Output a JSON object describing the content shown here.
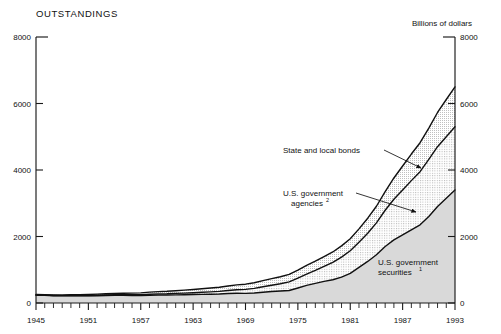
{
  "figure": {
    "title": "OUTSTANDINGS",
    "units_label": "Billions of dollars"
  },
  "chart_data": {
    "type": "area",
    "title": "OUTSTANDINGS",
    "subtitle": "",
    "xlabel": "",
    "ylabel": "Billions of dollars",
    "xlim": [
      1945,
      1993
    ],
    "ylim": [
      0,
      8000
    ],
    "yticks": [
      0,
      2000,
      4000,
      6000,
      8000
    ],
    "ytick_labels": [
      "0",
      "2000",
      "4000",
      "6000",
      "8000"
    ],
    "right_axis_yticks": [
      0,
      2000,
      4000,
      6000,
      8000
    ],
    "right_axis_ytick_labels": [
      "0",
      "2000",
      "4000",
      "6000",
      "8000"
    ],
    "xticks": [
      1945,
      1951,
      1957,
      1963,
      1969,
      1975,
      1981,
      1987,
      1993
    ],
    "xtick_labels": [
      "1945",
      "1951",
      "1957",
      "1963",
      "1969",
      "1975",
      "1981",
      "1987",
      "1993"
    ],
    "x_minor_tick_interval": 1,
    "grid": false,
    "legend_position": "inline-annotations",
    "stacking": "cumulative-from-bottom",
    "x": [
      1945,
      1946,
      1947,
      1948,
      1949,
      1950,
      1951,
      1952,
      1953,
      1954,
      1955,
      1956,
      1957,
      1958,
      1959,
      1960,
      1961,
      1962,
      1963,
      1964,
      1965,
      1966,
      1967,
      1968,
      1969,
      1970,
      1971,
      1972,
      1973,
      1974,
      1975,
      1976,
      1977,
      1978,
      1979,
      1980,
      1981,
      1982,
      1983,
      1984,
      1985,
      1986,
      1987,
      1988,
      1989,
      1990,
      1991,
      1992,
      1993
    ],
    "series": [
      {
        "name": "U.S. government securities",
        "footnote": "1",
        "fill": "light-stipple",
        "values": [
          235,
          230,
          220,
          215,
          215,
          215,
          215,
          220,
          225,
          230,
          230,
          225,
          225,
          235,
          240,
          240,
          245,
          250,
          255,
          260,
          265,
          270,
          285,
          295,
          290,
          300,
          325,
          345,
          360,
          375,
          450,
          530,
          590,
          650,
          700,
          780,
          890,
          1070,
          1250,
          1450,
          1700,
          1900,
          2050,
          2200,
          2350,
          2600,
          2900,
          3150,
          3400
        ],
        "value_at_1993": 3400
      },
      {
        "name": "U.S. government agencies",
        "footnote": "2",
        "fill": "medium-stipple",
        "values": [
          5,
          6,
          7,
          8,
          9,
          10,
          12,
          14,
          16,
          18,
          20,
          23,
          26,
          30,
          34,
          38,
          43,
          48,
          55,
          62,
          70,
          80,
          92,
          105,
          120,
          140,
          165,
          190,
          220,
          260,
          300,
          340,
          390,
          450,
          520,
          600,
          680,
          760,
          850,
          960,
          1090,
          1220,
          1350,
          1480,
          1600,
          1720,
          1800,
          1850,
          1900
        ],
        "value_at_1993": 1900,
        "cumulative_at_1993": 5300
      },
      {
        "name": "State and local bonds",
        "fill": "fine-stipple",
        "values": [
          15,
          16,
          18,
          20,
          22,
          25,
          28,
          32,
          36,
          40,
          45,
          50,
          55,
          62,
          68,
          74,
          82,
          90,
          98,
          106,
          115,
          124,
          134,
          145,
          156,
          168,
          182,
          196,
          210,
          225,
          240,
          258,
          276,
          295,
          315,
          338,
          362,
          400,
          450,
          500,
          560,
          640,
          720,
          800,
          870,
          940,
          1030,
          1120,
          1200
        ],
        "value_at_1993": 1200,
        "cumulative_at_1993": 6500
      }
    ],
    "annotations": [
      {
        "text": "State and local bonds",
        "footnote": "",
        "points_to_series": "State and local bonds",
        "points_to_year": 1988
      },
      {
        "text": "U.S. government agencies",
        "footnote": "2",
        "points_to_series": "U.S. government agencies",
        "points_to_year": 1988
      },
      {
        "text": "U.S. government securities",
        "footnote": "1",
        "points_to_series": "U.S. government securities",
        "points_to_year": 1989
      }
    ]
  },
  "annotations": {
    "state_local": {
      "line1": "State and local bonds",
      "sup": ""
    },
    "agencies": {
      "line1": "U.S. government",
      "line2": "agencies",
      "sup": "2"
    },
    "securities": {
      "line1": "U.S. government",
      "line2": "securities",
      "sup": "1"
    }
  }
}
